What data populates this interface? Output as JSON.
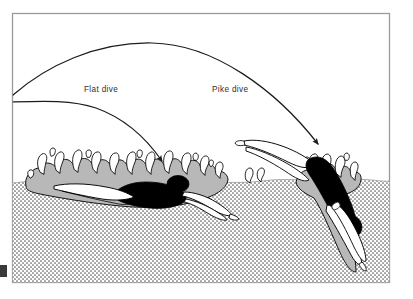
{
  "figure": {
    "name": "dive-entry-comparison-diagram",
    "frame": {
      "x": 12,
      "y": 13,
      "width": 378,
      "height": 270,
      "border_color": "#9a9a9a",
      "background_color": "#ffffff"
    },
    "edge_tick": {
      "name": "left-edge-tick-mark",
      "x": 0,
      "y": 265,
      "width": 7,
      "height": 12,
      "color": "#3a3a3a"
    }
  },
  "labels": [
    {
      "id": "flat-dive",
      "text": "Flat dive",
      "x": 84,
      "y": 92,
      "color": "#2f2f2f"
    },
    {
      "id": "pike-dive",
      "text": "Pike dive",
      "x": 212,
      "y": 92,
      "color": "#2f2f2f"
    }
  ],
  "trajectories": [
    {
      "id": "pike-dive-trajectory",
      "label": "Pike dive",
      "description": "High arcing flight path from left edge rising to an apex then descending steeply into the water",
      "start": [
        13,
        95
      ],
      "apex": [
        152,
        42
      ],
      "end": [
        320,
        146
      ],
      "arrowhead": "down-right",
      "color": "#1c1c1c",
      "stroke_width": 1.2
    },
    {
      "id": "flat-dive-trajectory",
      "label": "Flat dive",
      "description": "Low flat flight path from left edge bending down into a shallow water entry",
      "start": [
        13,
        102
      ],
      "apex": [
        70,
        101
      ],
      "end": [
        164,
        163
      ],
      "arrowhead": "down-right",
      "color": "#1c1c1c",
      "stroke_width": 1.2
    }
  ],
  "water": {
    "name": "water-body",
    "surface_level_y": 181,
    "fill_pattern": "halftone-dots",
    "dot_color": "#5a5a5a",
    "background_color": "#ffffff",
    "foam_color": "#b8b8b8"
  },
  "divers": [
    {
      "id": "flat-diver",
      "label": "Flat dive",
      "entry_angle_degrees": 8,
      "description": "Swimmer entering nearly horizontally, body just under the surface, large wide splash",
      "body_color": "#000000",
      "limb_color": "#ffffff",
      "outline_color": "#000000",
      "depth": "shallow",
      "splash": "wide-flat-splash"
    },
    {
      "id": "pike-diver",
      "label": "Pike dive",
      "entry_angle_degrees": 55,
      "description": "Swimmer entering steeply head first with legs still above the surface, narrow splash, travelling deep",
      "body_color": "#000000",
      "limb_color": "#ffffff",
      "outline_color": "#000000",
      "depth": "deep",
      "splash": "narrow-compact-splash"
    }
  ],
  "colors": {
    "ink": "#1c1c1c",
    "frame": "#9a9a9a",
    "foam_grey": "#b8b8b8",
    "water_dot": "#5a5a5a",
    "white": "#ffffff",
    "black": "#000000"
  }
}
